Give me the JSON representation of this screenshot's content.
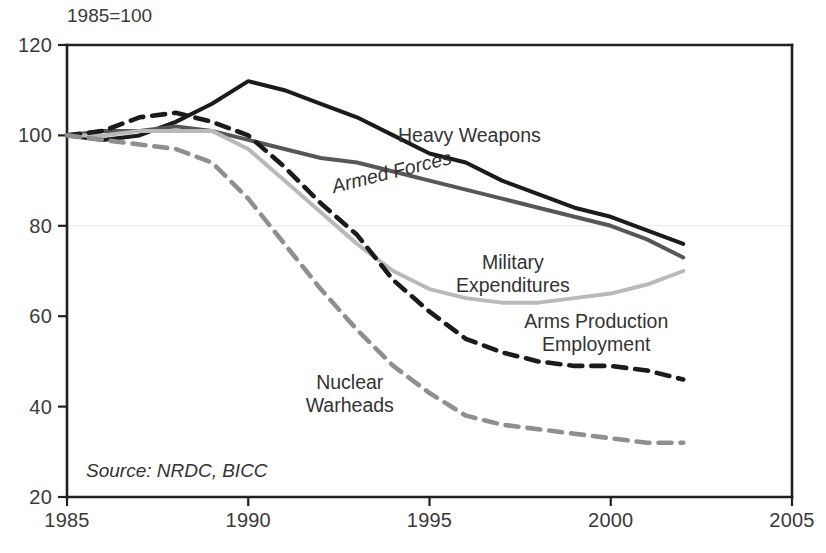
{
  "chart_data": {
    "type": "line",
    "title": "",
    "unit_note": "1985=100",
    "source_note": "Source: NRDC, BICC",
    "xlabel": "",
    "ylabel": "",
    "xlim": [
      1985,
      2005
    ],
    "ylim": [
      20,
      120
    ],
    "x_ticks": [
      "1985",
      "1990",
      "1995",
      "2000",
      "2005"
    ],
    "x_tick_values": [
      1985,
      1990,
      1995,
      2000,
      2005
    ],
    "y_ticks": [
      "20",
      "40",
      "60",
      "80",
      "100",
      "120"
    ],
    "y_tick_values": [
      20,
      40,
      60,
      80,
      100,
      120
    ],
    "grid": false,
    "legend": "inline-annotations",
    "x": [
      1985,
      1986,
      1987,
      1988,
      1989,
      1990,
      1991,
      1992,
      1993,
      1994,
      1995,
      1996,
      1997,
      1998,
      1999,
      2000,
      2001,
      2002
    ],
    "series": [
      {
        "name": "Heavy Weapons",
        "color": "#1b1b1b",
        "style": "solid",
        "width": 4.0,
        "label_x": 1996.1,
        "label_y": 98.5,
        "values": [
          100,
          99,
          100,
          103,
          107,
          112,
          110,
          107,
          104,
          100,
          96,
          94,
          90,
          87,
          84,
          82,
          79,
          76
        ]
      },
      {
        "name": "Armed Forces",
        "color": "#575757",
        "style": "solid",
        "width": 4.0,
        "label_x": 1994.0,
        "label_y": 90.5,
        "label_rotate": -14,
        "values": [
          100,
          101,
          101,
          102,
          101,
          99,
          97,
          95,
          94,
          92,
          90,
          88,
          86,
          84,
          82,
          80,
          77,
          73
        ]
      },
      {
        "name": "Military Expenditures",
        "color": "#b9b9b9",
        "style": "solid",
        "width": 4.0,
        "label_x": 1997.3,
        "label_y": 70.5,
        "values": [
          100,
          100,
          101,
          101,
          101,
          97,
          90,
          83,
          76,
          70,
          66,
          64,
          63,
          63,
          64,
          65,
          67,
          70
        ]
      },
      {
        "name": "Arms Production Employment",
        "color": "#1b1b1b",
        "style": "dashed",
        "width": 4.6,
        "dash": "13,9",
        "label_x": 1999.6,
        "label_y": 57.5,
        "values": [
          100,
          101,
          104,
          105,
          103,
          100,
          93,
          85,
          78,
          68,
          61,
          55,
          52,
          50,
          49,
          49,
          48,
          46
        ]
      },
      {
        "name": "Nuclear Warheads",
        "color": "#8f8f8f",
        "style": "dashed",
        "width": 4.6,
        "dash": "13,9",
        "label_x": 1992.8,
        "label_y": 44.0,
        "values": [
          100,
          99,
          98,
          97,
          94,
          86,
          76,
          66,
          57,
          49,
          43,
          38,
          36,
          35,
          34,
          33,
          32,
          32
        ]
      }
    ]
  },
  "geometry": {
    "plot_left": 67,
    "plot_right": 792,
    "plot_top": 45,
    "plot_bottom": 497
  }
}
